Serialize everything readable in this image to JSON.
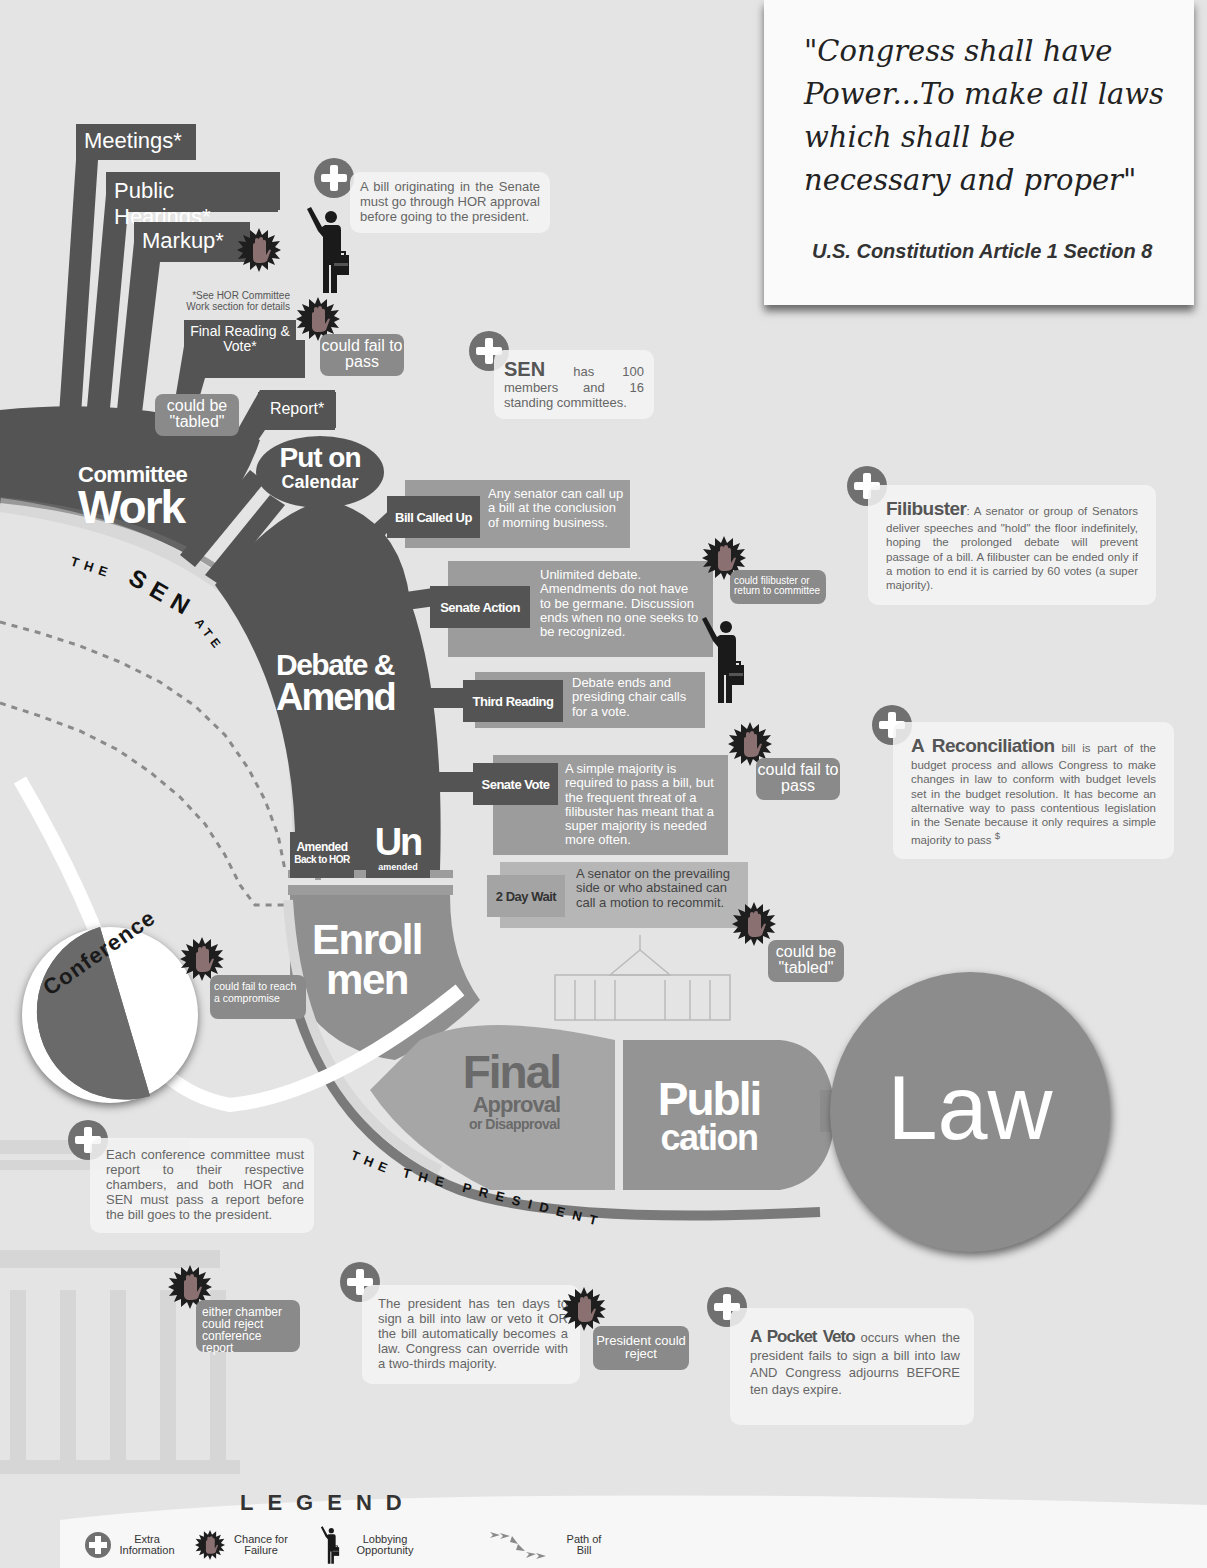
{
  "quote": {
    "text": "\"Congress shall have Power...To make all laws which shall be necessary and proper\"",
    "source": "U.S. Constitution Article 1 Section 8"
  },
  "committee": {
    "steps": [
      "Meetings*",
      "Public Hearings*",
      "Markup*",
      "Final Reading & Vote*",
      "Report*"
    ],
    "footnote": "*See HOR Committee Work section for details",
    "title_small": "Committee",
    "title_large": "Work",
    "tabled_label": "could be \"tabled\"",
    "fail_label": "could fail to pass"
  },
  "info": {
    "senate_origin": "A bill originating in the Senate must go through HOR approval before going to the president.",
    "sen_heading": "SEN",
    "sen_body": "has 100 members and 16 standing committees.",
    "filibuster_heading": "Filibuster",
    "filibuster_body": ": A senator or group of Senators deliver speeches and \"hold\" the floor indefinitely, hoping the prolonged debate will prevent passage of a bill. A filibuster can be ended only if a motion to end it is carried by 60 votes (a super majority).",
    "reconciliation_heading": "A Reconciliation",
    "reconciliation_body": " bill is part of the budget process and allows Congress to make changes in law to conform with budget levels set in the budget resolution. It has become an alternative way to pass contentious legislation in the Senate because it only requires a simple majority to pass",
    "reconciliation_mark": "$",
    "conference_report": "Each conference committee must report to their respective chambers, and both HOR and SEN must pass a report before the bill goes to the president.",
    "president_ten_days": "The president has ten days to sign a bill into law or veto it OR the bill automatically becomes a law. Congress can override with a two-thirds majority.",
    "pocket_veto_heading": "A Pocket Veto",
    "pocket_veto_body": " occurs when the president fails to sign a bill into law AND Congress adjourns BEFORE ten days expire."
  },
  "senate": {
    "arc_label_the": "THE",
    "arc_label_sen": "SEN",
    "arc_label_ate": "ATE",
    "calendar_line1": "Put on",
    "calendar_line2": "Calendar",
    "debate_line1": "Debate &",
    "debate_line2": "Amend",
    "actions": [
      {
        "label": "Bill Called Up",
        "desc": "Any senator can call up a bill at the conclusion of morning business."
      },
      {
        "label": "Senate Action",
        "desc": "Unlimited debate. Amendments do not have to be germane. Discussion ends when no one seeks to be recognized."
      },
      {
        "label": "Third Reading",
        "desc": "Debate ends and presiding chair calls for a vote."
      },
      {
        "label": "Senate Vote",
        "desc": "A simple majority is required to pass a bill, but the frequent threat of a filibuster has meant that a super majority is needed more often."
      },
      {
        "label": "2 Day Wait",
        "desc": "A senator on the prevailing side or who abstained can call a motion to recommit."
      }
    ],
    "filibuster_fail": "could filibuster or return to committee",
    "vote_fail": "could fail to pass",
    "wait_fail": "could be \"tabled\"",
    "amended_line1": "Amended",
    "amended_line2": "Back to HOR",
    "unamended_big": "Un",
    "unamended_small": "amended"
  },
  "conference": {
    "label": "Conference",
    "fail": "could fail to reach a compromise",
    "reject": "either chamber could reject conference report"
  },
  "enrollment": {
    "line1": "Enroll",
    "line2": "men"
  },
  "president": {
    "arc_label": "THE PRESIDENT",
    "final_big": "Final",
    "final_mid": "Approval",
    "final_small": "or Disapproval",
    "reject": "President could reject"
  },
  "publication": {
    "line1": "Publi",
    "line2": "cation"
  },
  "law": {
    "label": "Law"
  },
  "lobbyist_tag": "Lobbyist",
  "legend": {
    "title": "LEGEND",
    "items": [
      {
        "icon": "plus-circle-icon",
        "label": "Extra Information"
      },
      {
        "icon": "stop-hand-icon",
        "label": "Chance for Failure"
      },
      {
        "icon": "lobbyist-icon",
        "label": "Lobbying Opportunity"
      },
      {
        "icon": "arrow-path-icon",
        "label": "Path of Bill"
      }
    ]
  },
  "colors": {
    "background": "#e4e4e4",
    "dark": "#545454",
    "mid": "#7c7c7c",
    "light": "#9c9c9c",
    "law_circle": "#8c8c8c",
    "fail_star": "#1e1e1e",
    "hand": "#8a7070"
  }
}
